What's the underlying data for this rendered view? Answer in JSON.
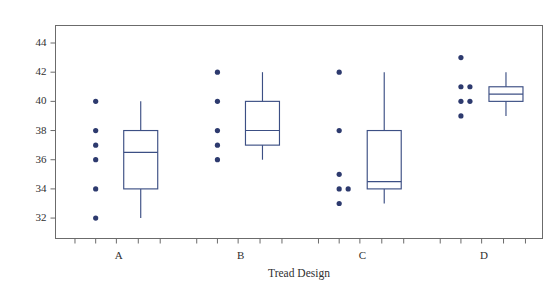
{
  "chart_data": {
    "type": "box",
    "title": "",
    "xlabel": "Tread Design",
    "ylabel": "",
    "categories": [
      "A",
      "B",
      "C",
      "D"
    ],
    "ylim": [
      30.6,
      45.2
    ],
    "yticks": [
      32,
      34,
      36,
      38,
      40,
      42,
      44
    ],
    "ytick_labels": [
      "32",
      "34",
      "36",
      "38",
      "40",
      "42",
      "44"
    ],
    "grid": false,
    "legend": "none",
    "series": [
      {
        "name": "A",
        "points": [
          40,
          38,
          37,
          36,
          34,
          32
        ],
        "box": {
          "min": 32,
          "q1": 34,
          "median": 36.5,
          "q3": 38,
          "max": 40
        }
      },
      {
        "name": "B",
        "points": [
          42,
          40,
          38,
          37,
          36
        ],
        "box": {
          "min": 36,
          "q1": 37,
          "median": 38,
          "q3": 40,
          "max": 42
        }
      },
      {
        "name": "C",
        "points": [
          42,
          38,
          35,
          34,
          34,
          33
        ],
        "box": {
          "min": 33,
          "q1": 34,
          "median": 34.5,
          "q3": 38,
          "max": 42
        }
      },
      {
        "name": "D",
        "points": [
          43,
          41,
          41,
          40,
          40,
          39
        ],
        "box": {
          "min": 39,
          "q1": 40,
          "median": 40.5,
          "q3": 41,
          "max": 42
        }
      }
    ],
    "colors": {
      "dot": "#2d3a6e",
      "box": "#3c4f84",
      "axis": "#6b6b6b",
      "text": "#2f2f2f",
      "background": "#ffffff"
    }
  }
}
